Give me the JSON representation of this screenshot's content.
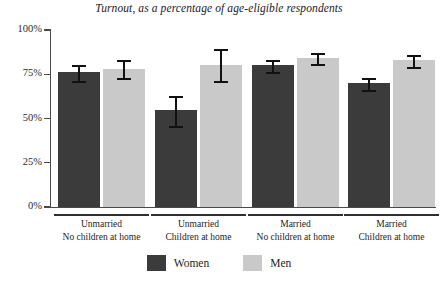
{
  "chart_data": {
    "type": "bar",
    "title": "Turnout, as a percentage of age-eligible respondents",
    "xlabel": "",
    "ylabel": "",
    "ylim": [
      0,
      100
    ],
    "yticks": [
      "0%",
      "25%",
      "50%",
      "75%",
      "100%"
    ],
    "ytick_values": [
      0,
      25,
      50,
      75,
      100
    ],
    "grid": false,
    "legend_position": "bottom-center",
    "categories": [
      {
        "line1": "Unmarried",
        "line2": "No children at home"
      },
      {
        "line1": "Unmarried",
        "line2": "Children at home"
      },
      {
        "line1": "Married",
        "line2": "No children at home"
      },
      {
        "line1": "Married",
        "line2": "Children at home"
      }
    ],
    "series": [
      {
        "name": "Women",
        "color": "#3b3b3b",
        "values": [
          76,
          55,
          80,
          70
        ],
        "err_low": [
          71,
          46,
          76,
          66
        ],
        "err_high": [
          80,
          63,
          83,
          73
        ]
      },
      {
        "name": "Men",
        "color": "#c9c9c9",
        "values": [
          78,
          80,
          84,
          83
        ],
        "err_low": [
          73,
          71,
          81,
          79
        ],
        "err_high": [
          83,
          89,
          87,
          86
        ]
      }
    ]
  },
  "legend": {
    "items": [
      {
        "label": "Women",
        "swatch": "women"
      },
      {
        "label": "Men",
        "swatch": "men"
      }
    ]
  }
}
